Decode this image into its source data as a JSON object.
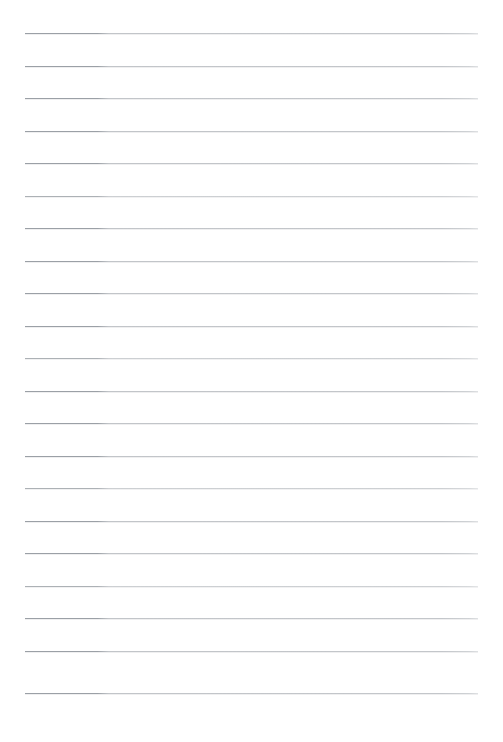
{
  "document": {
    "kind": "lined-paper-scan",
    "title": "",
    "visible_text": "",
    "background_color": "#ffffff",
    "rule_color": "#b9bcc0",
    "rule_color_left_segment": "#9ba0a6",
    "rule_color_right_segment": "#c3c6ca",
    "page_width": 503,
    "page_height": 742,
    "margins": {
      "left": 25,
      "right": 25,
      "top": 33,
      "bottom": 49
    },
    "ruling": {
      "line_count": 21,
      "line_spacing": 32.4,
      "line_thickness": 1,
      "first_line_y": 33,
      "last_line_y": 693,
      "line_start_x": 25,
      "line_end_x": 478,
      "line_length": 453,
      "darker_segment_end_x": 105
    },
    "lines": [
      {
        "index": 1,
        "y": 33,
        "weight": "strong",
        "content": ""
      },
      {
        "index": 2,
        "y": 66,
        "weight": "strong",
        "content": ""
      },
      {
        "index": 3,
        "y": 98,
        "weight": "strong",
        "content": ""
      },
      {
        "index": 4,
        "y": 131,
        "weight": "strong",
        "content": ""
      },
      {
        "index": 5,
        "y": 163,
        "weight": "strong",
        "content": ""
      },
      {
        "index": 6,
        "y": 196,
        "weight": "faint",
        "content": ""
      },
      {
        "index": 7,
        "y": 228,
        "weight": "strong",
        "content": ""
      },
      {
        "index": 8,
        "y": 261,
        "weight": "strong",
        "content": ""
      },
      {
        "index": 9,
        "y": 293,
        "weight": "strong",
        "content": ""
      },
      {
        "index": 10,
        "y": 326,
        "weight": "strong",
        "content": ""
      },
      {
        "index": 11,
        "y": 358,
        "weight": "faint",
        "content": ""
      },
      {
        "index": 12,
        "y": 391,
        "weight": "strong",
        "content": ""
      },
      {
        "index": 13,
        "y": 423,
        "weight": "strong",
        "content": ""
      },
      {
        "index": 14,
        "y": 456,
        "weight": "strong",
        "content": ""
      },
      {
        "index": 15,
        "y": 488,
        "weight": "faint",
        "content": ""
      },
      {
        "index": 16,
        "y": 521,
        "weight": "strong",
        "content": ""
      },
      {
        "index": 17,
        "y": 553,
        "weight": "strong",
        "content": ""
      },
      {
        "index": 18,
        "y": 586,
        "weight": "faint",
        "content": ""
      },
      {
        "index": 19,
        "y": 618,
        "weight": "strong",
        "content": ""
      },
      {
        "index": 20,
        "y": 651,
        "weight": "strong",
        "content": ""
      },
      {
        "index": 21,
        "y": 693,
        "weight": "strong",
        "content": ""
      }
    ]
  }
}
